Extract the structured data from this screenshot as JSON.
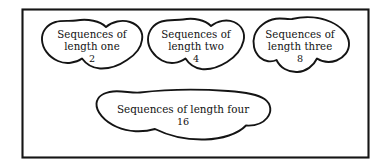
{
  "figure": {
    "type": "venn-like-set-diagram",
    "frame": {
      "name": "outer-rectangle",
      "stroke_color": "#151515",
      "fill_color": "#ffffff"
    },
    "background_color": "#ffffff",
    "ink_color": "#111111"
  },
  "sets": [
    {
      "id": "length-one",
      "line1": "Sequences of",
      "line2": "length one",
      "count": "2"
    },
    {
      "id": "length-two",
      "line1": "Sequences of",
      "line2": "length two",
      "count": "4"
    },
    {
      "id": "length-three",
      "line1": "Sequences of",
      "line2": "length three",
      "count": "8"
    },
    {
      "id": "length-four",
      "line1": "Sequences of length four",
      "line2": "",
      "count": "16"
    }
  ]
}
